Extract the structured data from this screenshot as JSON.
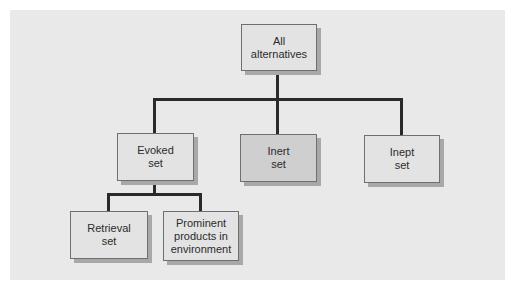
{
  "diagram": {
    "type": "hierarchy-tree",
    "nodes": {
      "root": {
        "label": "All\nalternatives"
      },
      "evoked": {
        "label": "Evoked\nset"
      },
      "inert": {
        "label": "Inert\nset"
      },
      "inept": {
        "label": "Inept\nset"
      },
      "retrieval": {
        "label": "Retrieval\nset"
      },
      "prominent": {
        "label": "Prominent\nproducts in\nenvironment"
      }
    },
    "edges": [
      [
        "All alternatives",
        "Evoked set"
      ],
      [
        "All alternatives",
        "Inert set"
      ],
      [
        "All alternatives",
        "Inept set"
      ],
      [
        "Evoked set",
        "Retrieval set"
      ],
      [
        "Evoked set",
        "Prominent products in environment"
      ]
    ],
    "colors": {
      "panel": "#e9e9e9",
      "box": "#e3e3e3",
      "box_highlight": "#cfcfcf",
      "connector": "#2a2a2a"
    }
  }
}
